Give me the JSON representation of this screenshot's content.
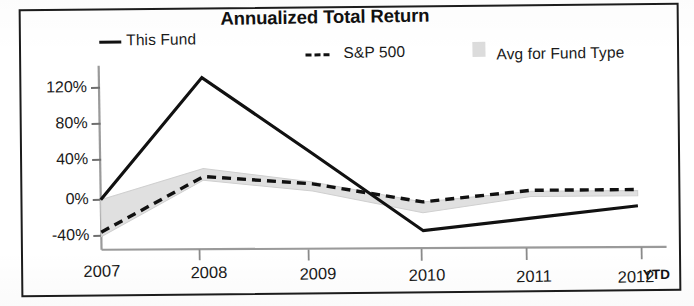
{
  "chart_data": {
    "type": "line",
    "title": "Annualized Total Return",
    "xlabel": "",
    "ylabel": "",
    "categories": [
      "2007",
      "2008",
      "2009",
      "2010",
      "2011",
      "2012"
    ],
    "x_axis_note": "YTD",
    "ytick_labels": [
      "120%",
      "80%",
      "40%",
      "0%",
      "-40%"
    ],
    "ytick_values": [
      120,
      80,
      40,
      0,
      -40
    ],
    "ylim": [
      -50,
      140
    ],
    "grid": false,
    "legend_position": "top",
    "series": [
      {
        "name": "This Fund",
        "style": "solid",
        "color": "#111111",
        "values": [
          0,
          134,
          48,
          -40,
          -28,
          -16
        ]
      },
      {
        "name": "S&P 500",
        "style": "dashed",
        "color": "#111111",
        "values": [
          -36,
          24,
          14,
          -8,
          3,
          2
        ]
      },
      {
        "name": "Avg for Fund Type",
        "style": "band",
        "color": "#dcdcdc",
        "values": [
          -20,
          29,
          12,
          -13,
          0,
          -2
        ],
        "band_upper": [
          0,
          33,
          16,
          -8,
          2,
          1
        ],
        "band_lower": [
          -41,
          20,
          6,
          -20,
          -4,
          -5
        ]
      }
    ]
  },
  "legend": {
    "fund_label": "This Fund",
    "sp_label": "S&P 500",
    "avg_label": "Avg for Fund Type"
  },
  "axis": {
    "y_ticks": [
      "120%",
      "80%",
      "40%",
      "0%",
      "-40%"
    ],
    "x_ticks": [
      "2007",
      "2008",
      "2009",
      "2010",
      "2011",
      "2012"
    ],
    "ytd": "YTD"
  }
}
